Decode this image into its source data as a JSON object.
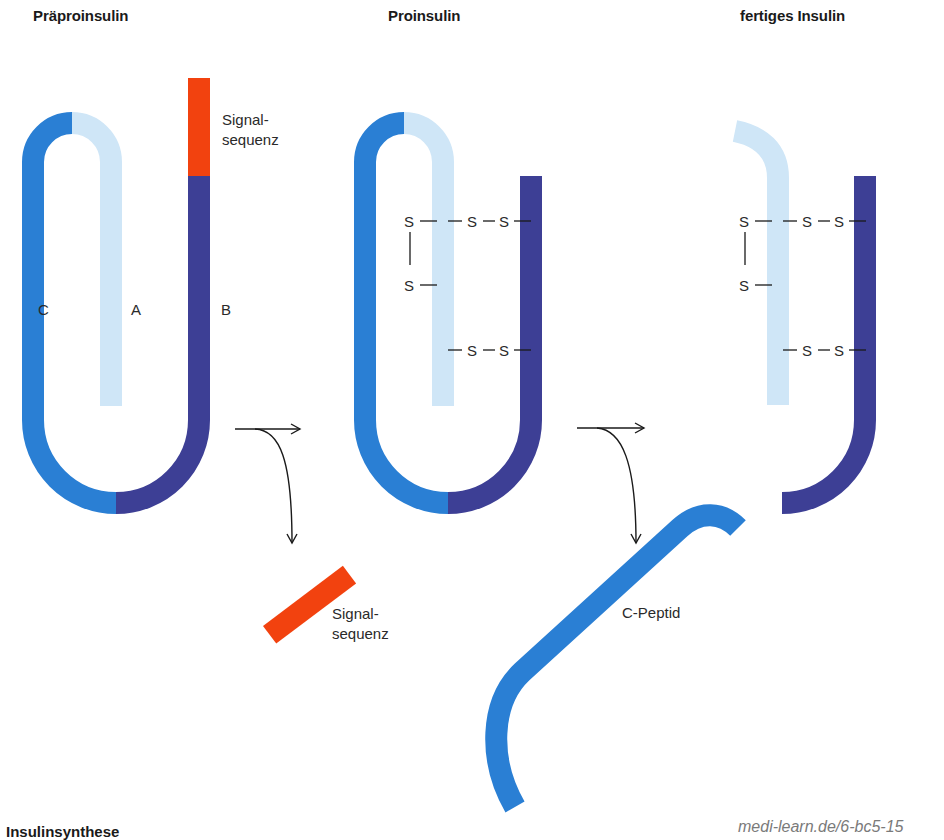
{
  "stages": [
    {
      "id": "praeproinsulin",
      "title": "Präproinsulin"
    },
    {
      "id": "proinsulin",
      "title": "Proinsulin"
    },
    {
      "id": "fertiges-insulin",
      "title": "fertiges Insulin"
    }
  ],
  "chain_labels": {
    "c": "C",
    "a": "A",
    "b": "B"
  },
  "signal_label": {
    "line1": "Signal-",
    "line2": "sequenz"
  },
  "cleaved_signal_label": {
    "line1": "Signal-",
    "line2": "sequenz"
  },
  "c_peptide_label": "C-Peptid",
  "disulfide": {
    "s": "S",
    "bond": "—"
  },
  "caption": "Insulinsynthese",
  "source": "medi-learn.de/6-bc5-15",
  "colors": {
    "chain_c": "#2a7fd4",
    "chain_a": "#cfe6f7",
    "chain_b": "#3d3f95",
    "signal": "#f2420f",
    "arrow": "#1a1a1a",
    "text": "#2a2a2a"
  }
}
